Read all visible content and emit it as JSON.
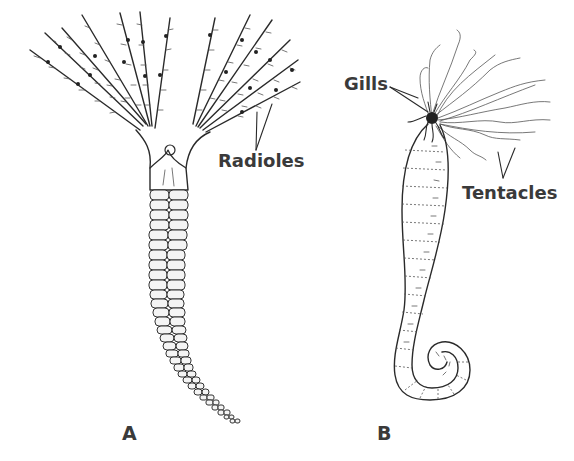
{
  "figure": {
    "panels": [
      {
        "id": "A",
        "label": "A",
        "subject": "fan worm with radioles and segmented tube body",
        "annotations": [
          {
            "text": "Radioles",
            "points_to": "radioles"
          }
        ]
      },
      {
        "id": "B",
        "label": "B",
        "subject": "coiled worm with gills and tentacles",
        "annotations": [
          {
            "text": "Gills",
            "points_to": "gills"
          },
          {
            "text": "Tentacles",
            "points_to": "tentacles"
          }
        ]
      }
    ],
    "colors": {
      "background": "#ffffff",
      "ink": "#2a2a2a",
      "label": "#3a3a3a"
    }
  }
}
